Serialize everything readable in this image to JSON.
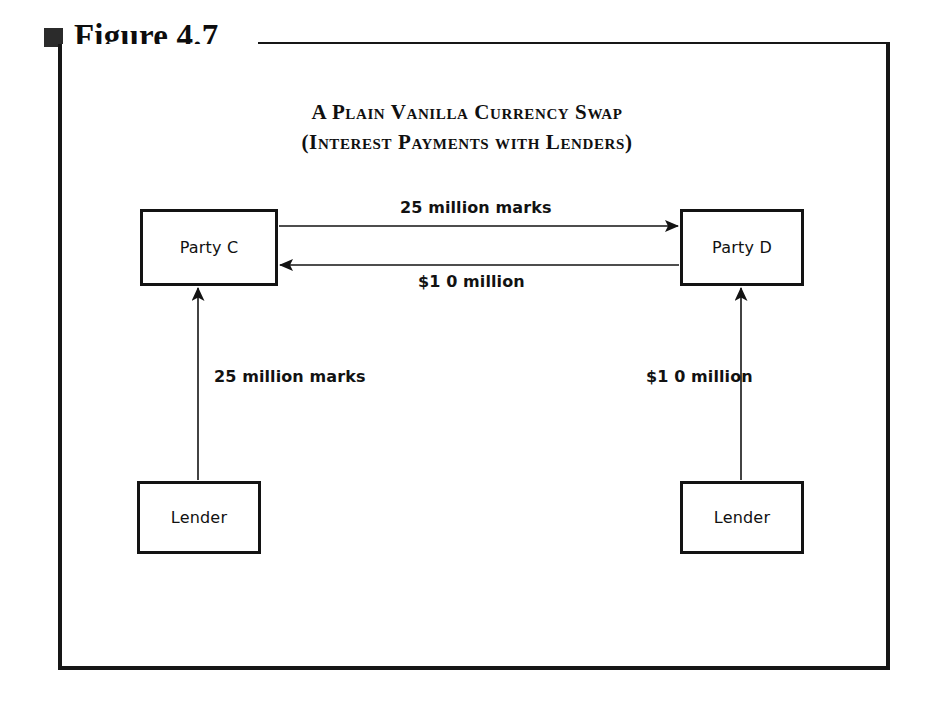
{
  "figure": {
    "marker_icon": "filled-square-icon",
    "label": "Figure 4.7"
  },
  "diagram": {
    "title_line1": "A Plain Vanilla Currency Swap",
    "title_line2": "(Interest Payments with Lenders)",
    "nodes": [
      {
        "id": "party-c",
        "label": "Party C"
      },
      {
        "id": "party-d",
        "label": "Party D"
      },
      {
        "id": "lender-left",
        "label": "Lender"
      },
      {
        "id": "lender-right",
        "label": "Lender"
      }
    ],
    "edges": [
      {
        "id": "party-c-to-party-d",
        "label": "25 million marks",
        "from": "party-c",
        "to": "party-d",
        "direction": "right"
      },
      {
        "id": "party-d-to-party-c",
        "label": "$1 0 million",
        "from": "party-d",
        "to": "party-c",
        "direction": "left"
      },
      {
        "id": "lender-left-to-party-c",
        "label": "25 million marks",
        "from": "lender-left",
        "to": "party-c",
        "direction": "up"
      },
      {
        "id": "lender-right-to-party-d",
        "label": "$1 0 million",
        "from": "lender-right",
        "to": "party-d",
        "direction": "up"
      }
    ],
    "colors": {
      "ink": "#131313",
      "background": "#ffffff"
    }
  }
}
